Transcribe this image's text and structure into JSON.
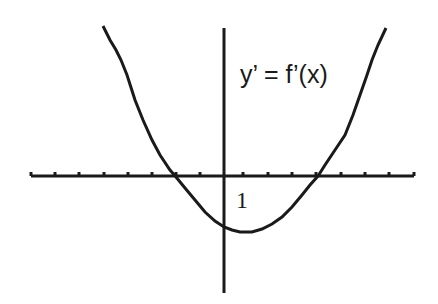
{
  "chart_data": {
    "type": "line",
    "title": "",
    "function_label": "y’ = f’(x)",
    "xlabel": "",
    "ylabel": "",
    "tick_label": "1",
    "x_roots": [
      -2,
      4
    ],
    "vertex_x": 1,
    "x_ticks": [
      -8,
      -7,
      -6,
      -5,
      -4,
      -3,
      -2,
      -1,
      1,
      2,
      3,
      4,
      5,
      6,
      7,
      8
    ],
    "grid": false,
    "legend": "none",
    "colors": {
      "stroke": "#1a1a1a",
      "background": "#ffffff"
    },
    "pixel": {
      "x_axis": {
        "x1": 31,
        "x2": 414,
        "y": 176
      },
      "y_axis": {
        "x": 224,
        "y1": 28,
        "y2": 293
      },
      "ticks_x": [
        31,
        55,
        79,
        104,
        128,
        152,
        176,
        200,
        243,
        268,
        292,
        316,
        341,
        365,
        389,
        414
      ],
      "curve_points": [
        [
          103,
          26
        ],
        [
          110,
          40
        ],
        [
          116,
          50
        ],
        [
          121,
          60
        ],
        [
          127,
          75
        ],
        [
          135,
          100
        ],
        [
          143,
          120
        ],
        [
          152,
          140
        ],
        [
          160,
          155
        ],
        [
          170,
          170
        ],
        [
          176,
          177
        ],
        [
          185,
          188
        ],
        [
          195,
          200
        ],
        [
          205,
          212
        ],
        [
          215,
          221
        ],
        [
          224,
          227
        ],
        [
          232,
          230
        ],
        [
          240,
          232
        ],
        [
          252,
          232
        ],
        [
          262,
          229
        ],
        [
          272,
          224
        ],
        [
          282,
          217
        ],
        [
          292,
          207
        ],
        [
          302,
          195
        ],
        [
          310,
          185
        ],
        [
          318,
          176
        ],
        [
          325,
          165
        ],
        [
          335,
          150
        ],
        [
          345,
          135
        ],
        [
          353,
          115
        ],
        [
          360,
          95
        ],
        [
          367,
          75
        ],
        [
          372,
          60
        ],
        [
          378,
          45
        ],
        [
          386,
          28
        ]
      ],
      "function_label_pos": {
        "x": 240,
        "y": 83
      },
      "tick_label_pos": {
        "x": 236,
        "y": 208
      }
    }
  }
}
